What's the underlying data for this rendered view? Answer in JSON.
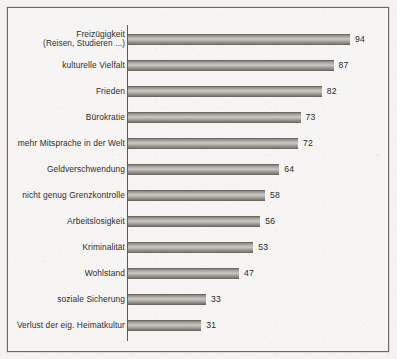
{
  "chart_data": {
    "type": "bar",
    "orientation": "horizontal",
    "title": "",
    "subtitle": "",
    "xlabel": "",
    "ylabel": "",
    "xlim": [
      0,
      100
    ],
    "grid": false,
    "legend": null,
    "bar_color": "#b0aca8",
    "frame_color": "#6d6a66",
    "background_color": "#f4f3f1",
    "categories": [
      "Freizügigkeit (Reisen, Studieren ...)",
      "kulturelle Vielfalt",
      "Frieden",
      "Bürokratie",
      "mehr Mitsprache in der Welt",
      "Geldverschwendung",
      "nicht genug Grenzkontrolle",
      "Arbeitslosigkeit",
      "Kriminalität",
      "Wohlstand",
      "soziale Sicherung",
      "Verlust der eig. Heimatkultur"
    ],
    "values": [
      94,
      87,
      82,
      73,
      72,
      64,
      58,
      56,
      53,
      47,
      33,
      31
    ],
    "bars": [
      {
        "label_line1": "Freizügigkeit",
        "label_line2": "(Reisen, Studieren ...)",
        "value": 94
      },
      {
        "label_line1": "kulturelle Vielfalt",
        "label_line2": "",
        "value": 87
      },
      {
        "label_line1": "Frieden",
        "label_line2": "",
        "value": 82
      },
      {
        "label_line1": "Bürokratie",
        "label_line2": "",
        "value": 73
      },
      {
        "label_line1": "mehr Mitsprache in der Welt",
        "label_line2": "",
        "value": 72
      },
      {
        "label_line1": "Geldverschwendung",
        "label_line2": "",
        "value": 64
      },
      {
        "label_line1": "nicht genug Grenzkontrolle",
        "label_line2": "",
        "value": 58
      },
      {
        "label_line1": "Arbeitslosigkeit",
        "label_line2": "",
        "value": 56
      },
      {
        "label_line1": "Kriminalität",
        "label_line2": "",
        "value": 53
      },
      {
        "label_line1": "Wohlstand",
        "label_line2": "",
        "value": 47
      },
      {
        "label_line1": "soziale Sicherung",
        "label_line2": "",
        "value": 33
      },
      {
        "label_line1": "Verlust der eig. Heimatkultur",
        "label_line2": "",
        "value": 31
      }
    ]
  }
}
